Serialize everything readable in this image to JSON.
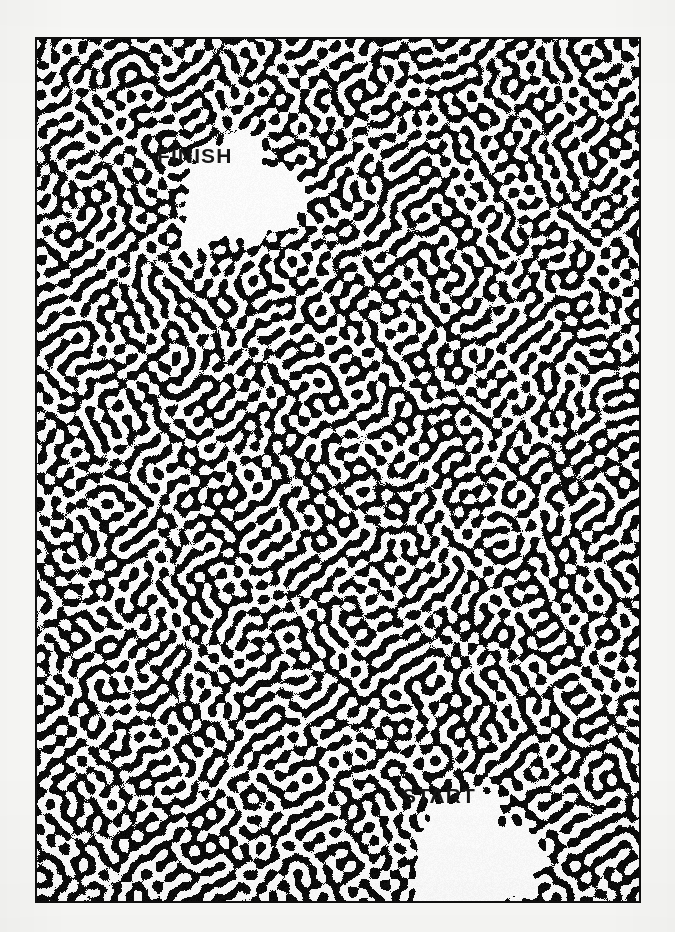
{
  "page": {
    "type": "printed-maze-puzzle",
    "background_color": "#f8f8f6",
    "width": 675,
    "height": 932
  },
  "maze": {
    "name": "organic-labyrinth-maze",
    "frame": {
      "x": 35,
      "y": 37,
      "width": 606,
      "height": 866,
      "border_color": "#111111",
      "border_width": 2
    },
    "wall_color": "#0a0a0a",
    "path_color": "#ffffff",
    "pattern_style": "reaction-diffusion labyrinth",
    "pattern_wavelength_px": 14
  },
  "markers": {
    "finish": {
      "label": "FINISH",
      "text_color": "#161616",
      "x": 155,
      "y": 143,
      "clearing": {
        "center_x": 235,
        "center_y": 191,
        "radius_x": 58,
        "radius_y": 52
      }
    },
    "start": {
      "label": "START",
      "text_color": "#161616",
      "x": 400,
      "y": 783,
      "clearing": {
        "center_x": 470,
        "center_y": 853,
        "radius_x": 62,
        "radius_y": 56
      }
    }
  }
}
